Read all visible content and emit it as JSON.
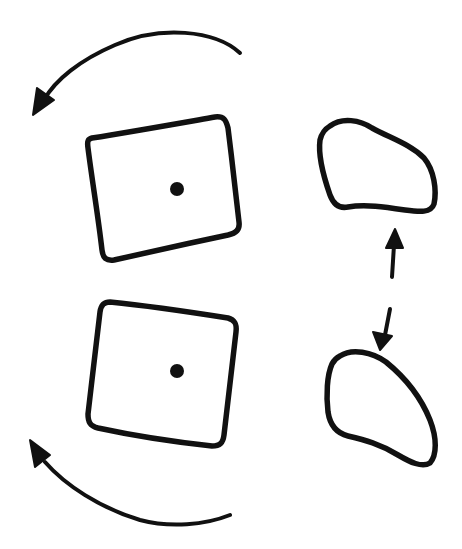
{
  "diagram": {
    "type": "hand-drawn sketch",
    "background": "#ffffff",
    "ink_color": "#111111",
    "elements": [
      {
        "id": "top-rotation-arrow",
        "kind": "curved-arrow",
        "direction": "counterclockwise",
        "label": ""
      },
      {
        "id": "top-square",
        "kind": "rotated-square",
        "has_center_dot": true,
        "label": ""
      },
      {
        "id": "top-blob",
        "kind": "irregular-shape",
        "label": ""
      },
      {
        "id": "up-arrow",
        "kind": "straight-arrow",
        "direction": "up",
        "label": ""
      },
      {
        "id": "down-arrow",
        "kind": "straight-arrow",
        "direction": "down",
        "label": ""
      },
      {
        "id": "bottom-square",
        "kind": "rotated-square",
        "has_center_dot": true,
        "label": ""
      },
      {
        "id": "bottom-blob",
        "kind": "irregular-shape",
        "label": ""
      },
      {
        "id": "bottom-rotation-arrow",
        "kind": "curved-arrow",
        "direction": "clockwise",
        "label": ""
      }
    ]
  }
}
